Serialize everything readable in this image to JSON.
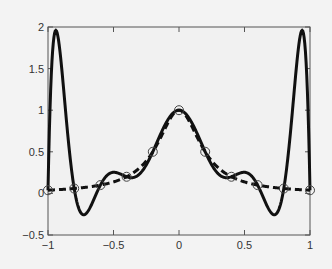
{
  "chart_data": {
    "type": "line",
    "title": "",
    "xlabel": "",
    "ylabel": "",
    "xlim": [
      -1,
      1
    ],
    "ylim": [
      -0.5,
      2
    ],
    "grid": false,
    "legend": null,
    "xticks": [
      -1,
      -0.5,
      0,
      0.5,
      1
    ],
    "yticks": [
      -0.5,
      0,
      0.5,
      1,
      1.5,
      2
    ],
    "xtick_labels": [
      "−1",
      "−0.5",
      "0",
      "0.5",
      "1"
    ],
    "ytick_labels": [
      "−0.5",
      "0",
      "0.5",
      "1",
      "1.5",
      "2"
    ],
    "series": [
      {
        "name": "interpolating polynomial",
        "style": "solid",
        "color": "#111111",
        "x": [
          -1,
          -0.96,
          -0.9,
          -0.8,
          -0.72,
          -0.6,
          -0.5,
          -0.4,
          -0.3,
          -0.2,
          -0.1,
          0,
          0.1,
          0.2,
          0.3,
          0.4,
          0.5,
          0.6,
          0.72,
          0.8,
          0.9,
          0.96,
          1
        ],
        "y": [
          0.04,
          1.95,
          0.9,
          0.04,
          -0.27,
          0.05,
          0.25,
          0.24,
          0.32,
          0.5,
          0.85,
          1.0,
          0.85,
          0.5,
          0.32,
          0.24,
          0.25,
          0.05,
          -0.27,
          0.04,
          0.9,
          1.95,
          0.04
        ]
      },
      {
        "name": "function 1/(1+25x^2)",
        "style": "dashed",
        "color": "#111111",
        "x": [
          -1,
          -0.8,
          -0.6,
          -0.4,
          -0.2,
          0,
          0.2,
          0.4,
          0.6,
          0.8,
          1
        ],
        "y": [
          0.038,
          0.059,
          0.1,
          0.2,
          0.5,
          1.0,
          0.5,
          0.2,
          0.1,
          0.059,
          0.038
        ]
      },
      {
        "name": "interpolation nodes",
        "style": "markers",
        "marker": "circle",
        "x": [
          -1,
          -0.8,
          -0.6,
          -0.4,
          -0.2,
          0,
          0.2,
          0.4,
          0.6,
          0.8,
          1
        ],
        "y": [
          0.038,
          0.059,
          0.1,
          0.2,
          0.5,
          1.0,
          0.5,
          0.2,
          0.1,
          0.059,
          0.038
        ]
      }
    ]
  }
}
